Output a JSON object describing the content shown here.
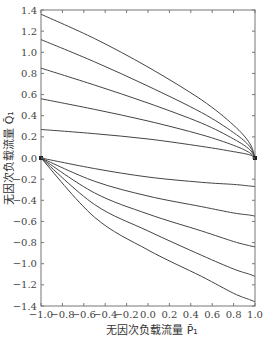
{
  "chart_data": {
    "type": "line",
    "title": "",
    "xlabel": "无因次负载流量 P̄₁",
    "ylabel": "无因次负载流量 Q̄₁",
    "xlim": [
      -1.0,
      1.0
    ],
    "ylim": [
      -1.4,
      1.4
    ],
    "grid": false,
    "legend": null,
    "x_ticks": [
      "-1.0",
      "-0.8",
      "-0.6",
      "-0.4",
      "-0.2",
      "0.0",
      "0.2",
      "0.4",
      "0.6",
      "0.8",
      "1.0"
    ],
    "y_ticks": [
      "1.4",
      "1.2",
      "1.0",
      "0.8",
      "0.6",
      "0.4",
      "0.2",
      "0.0",
      "-0.2",
      "-0.4",
      "-0.6",
      "-0.8",
      "-1.0",
      "-1.2",
      "-1.4"
    ],
    "x": [
      -1.0,
      -0.5,
      0.0,
      0.5,
      0.8,
      0.95,
      1.0
    ],
    "series": [
      {
        "name": "upper-1",
        "values": [
          1.36,
          1.13,
          0.86,
          0.55,
          0.31,
          0.14,
          0.0
        ]
      },
      {
        "name": "upper-2",
        "values": [
          1.12,
          0.91,
          0.68,
          0.43,
          0.24,
          0.11,
          0.0
        ]
      },
      {
        "name": "upper-3",
        "values": [
          0.85,
          0.69,
          0.52,
          0.33,
          0.18,
          0.08,
          0.0
        ]
      },
      {
        "name": "upper-4",
        "values": [
          0.56,
          0.46,
          0.35,
          0.22,
          0.12,
          0.05,
          0.0
        ]
      },
      {
        "name": "upper-5",
        "values": [
          0.27,
          0.23,
          0.18,
          0.11,
          0.06,
          0.03,
          0.0
        ]
      },
      {
        "name": "lower-1",
        "values": [
          0.0,
          -0.1,
          -0.18,
          -0.23,
          -0.25,
          -0.265,
          -0.27
        ]
      },
      {
        "name": "lower-2",
        "values": [
          0.0,
          -0.22,
          -0.36,
          -0.46,
          -0.52,
          -0.54,
          -0.55
        ]
      },
      {
        "name": "lower-3",
        "values": [
          0.0,
          -0.33,
          -0.53,
          -0.69,
          -0.79,
          -0.83,
          -0.84
        ]
      },
      {
        "name": "lower-4",
        "values": [
          0.0,
          -0.44,
          -0.69,
          -0.92,
          -1.05,
          -1.1,
          -1.12
        ]
      },
      {
        "name": "lower-5",
        "values": [
          0.0,
          -0.56,
          -0.87,
          -1.12,
          -1.28,
          -1.34,
          -1.36
        ]
      }
    ],
    "annotations": [
      "convergence point at (1.0, 0.0)",
      "convergence point at (-1.0, 0.0)"
    ]
  },
  "style": {
    "line_color": "#444444",
    "axis_color": "#777777",
    "background": "#ffffff"
  }
}
